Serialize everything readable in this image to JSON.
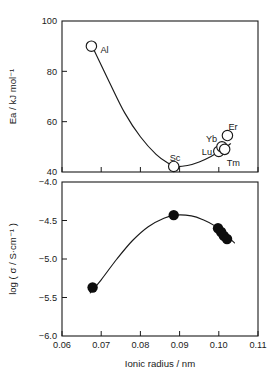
{
  "figure": {
    "background": "#ffffff",
    "ink_color": "#1a1a1a"
  },
  "chart_data": [
    {
      "id": "activation-energy-panel",
      "type": "scatter",
      "title": "",
      "xlabel": "",
      "ylabel": "Ea / kJ mol⁻¹",
      "xlim": [
        0.06,
        0.11
      ],
      "ylim": [
        40,
        100
      ],
      "xticks": [
        0.06,
        0.07,
        0.08,
        0.09,
        0.1,
        0.11
      ],
      "xticklabels": [
        "",
        "",
        "",
        "",
        "",
        ""
      ],
      "yticks": [
        40,
        60,
        80,
        100
      ],
      "yticklabels": [
        "40",
        "60",
        "80",
        "100"
      ],
      "grid": false,
      "legend": "none",
      "marker_style": "open-circle",
      "points": [
        {
          "label": "Al",
          "x": 0.0675,
          "y": 90.0,
          "label_dx": 9,
          "label_dy": 4
        },
        {
          "label": "Sc",
          "x": 0.0885,
          "y": 42.2,
          "label_dx": -4,
          "label_dy": -9
        },
        {
          "label": "Lu",
          "x": 0.1,
          "y": 48.2,
          "label_dx": -17,
          "label_dy": 0
        },
        {
          "label": "Yb",
          "x": 0.1008,
          "y": 50.0,
          "label_dx": -16,
          "label_dy": -8
        },
        {
          "label": "Tm",
          "x": 0.1015,
          "y": 49.0,
          "label_dx": 2,
          "label_dy": 13
        },
        {
          "label": "Er",
          "x": 0.1022,
          "y": 54.5,
          "label_dx": 1,
          "label_dy": -9
        }
      ],
      "curve": [
        {
          "x": 0.068,
          "y": 89.0
        },
        {
          "x": 0.072,
          "y": 76.0
        },
        {
          "x": 0.076,
          "y": 63.5
        },
        {
          "x": 0.08,
          "y": 54.0
        },
        {
          "x": 0.084,
          "y": 47.0
        },
        {
          "x": 0.087,
          "y": 43.6
        },
        {
          "x": 0.089,
          "y": 42.2
        },
        {
          "x": 0.092,
          "y": 42.6
        },
        {
          "x": 0.095,
          "y": 44.0
        },
        {
          "x": 0.098,
          "y": 46.2
        },
        {
          "x": 0.101,
          "y": 49.0
        },
        {
          "x": 0.103,
          "y": 51.2
        }
      ]
    },
    {
      "id": "conductivity-panel",
      "type": "scatter",
      "title": "",
      "xlabel": "Ionic radius / nm",
      "ylabel": "log ( σ / S·cm⁻¹ )",
      "xlim": [
        0.06,
        0.11
      ],
      "ylim": [
        -6.0,
        -4.0
      ],
      "xticks": [
        0.06,
        0.07,
        0.08,
        0.09,
        0.1,
        0.11
      ],
      "xticklabels": [
        "0.06",
        "0.07",
        "0.08",
        "0.09",
        "0.10",
        "0.11"
      ],
      "yticks": [
        -6.0,
        -5.5,
        -5.0,
        -4.5,
        -4.0
      ],
      "yticklabels": [
        "−6.0",
        "−5.5",
        "−5.0",
        "−4.5",
        "−4.0"
      ],
      "grid": false,
      "legend": "none",
      "marker_style": "filled-circle",
      "points": [
        {
          "label": "",
          "x": 0.0678,
          "y": -5.37
        },
        {
          "label": "",
          "x": 0.0885,
          "y": -4.43
        },
        {
          "label": "",
          "x": 0.0998,
          "y": -4.6
        },
        {
          "label": "",
          "x": 0.1006,
          "y": -4.65
        },
        {
          "label": "",
          "x": 0.1013,
          "y": -4.7
        },
        {
          "label": "",
          "x": 0.1021,
          "y": -4.74
        }
      ],
      "curve": [
        {
          "x": 0.0672,
          "y": -5.44
        },
        {
          "x": 0.07,
          "y": -5.27
        },
        {
          "x": 0.074,
          "y": -5.0
        },
        {
          "x": 0.078,
          "y": -4.76
        },
        {
          "x": 0.082,
          "y": -4.58
        },
        {
          "x": 0.086,
          "y": -4.47
        },
        {
          "x": 0.089,
          "y": -4.43
        },
        {
          "x": 0.093,
          "y": -4.44
        },
        {
          "x": 0.096,
          "y": -4.49
        },
        {
          "x": 0.099,
          "y": -4.57
        },
        {
          "x": 0.102,
          "y": -4.7
        },
        {
          "x": 0.104,
          "y": -4.79
        }
      ]
    }
  ]
}
